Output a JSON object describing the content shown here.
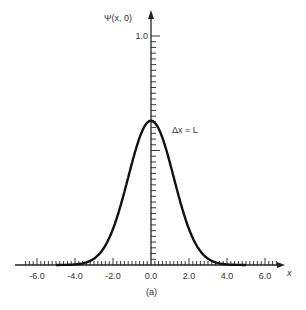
{
  "chart_data": {
    "type": "line",
    "title": "",
    "panel_label": "(a)",
    "xlabel": "x",
    "ylabel": "Ψ(x, 0)",
    "annotation": "Δx = L",
    "xlim": [
      -7.0,
      7.0
    ],
    "ylim": [
      0,
      1.0
    ],
    "x_tick_labels": [
      "-6.0",
      "-4.0",
      "-2.0",
      "0.0",
      "2.0",
      "4.0",
      "6.0"
    ],
    "x_ticks": [
      -6,
      -4,
      -2,
      0,
      2,
      4,
      6
    ],
    "y_tick_labels": [
      "1.0"
    ],
    "y_ticks": [
      1.0
    ],
    "x_minor_step": 0.2,
    "y_minor_step": 0.025,
    "grid": false,
    "legend": null,
    "series": [
      {
        "name": "Ψ(x, 0)",
        "function": "gaussian",
        "amplitude": 0.63,
        "sigma": 1.2,
        "x_range": [
          -5.0,
          5.0
        ],
        "x": [
          -5,
          -4,
          -3,
          -2.5,
          -2,
          -1.5,
          -1,
          -0.5,
          0,
          0.5,
          1,
          1.5,
          2,
          2.5,
          3,
          4,
          5
        ],
        "values": [
          0.0,
          0.025,
          0.028,
          0.072,
          0.157,
          0.288,
          0.445,
          0.578,
          0.63,
          0.578,
          0.445,
          0.288,
          0.157,
          0.072,
          0.028,
          0.025,
          0.0
        ]
      }
    ],
    "colors": {
      "curve": "#111111",
      "axes": "#222222",
      "text": "#333333"
    }
  }
}
